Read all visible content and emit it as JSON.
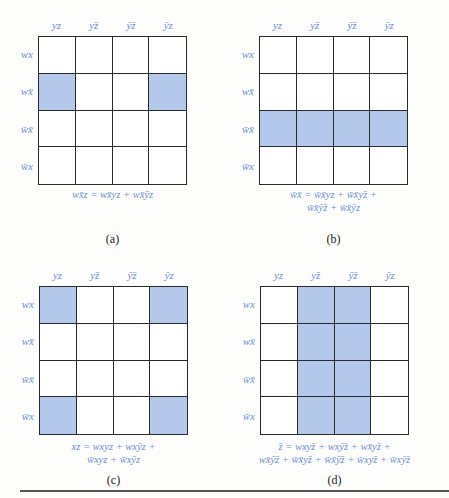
{
  "diagram": {
    "type": "Karnaugh maps (4-variable)",
    "column_headers": [
      "yz",
      "yz̄",
      "ȳz̄",
      "ȳz"
    ],
    "row_headers": [
      "wx",
      "wx̄",
      "w̄x̄",
      "w̄x"
    ],
    "highlight_color": "#b3c8ea",
    "label_color": "#6f8fcf",
    "panels": [
      {
        "id": "a",
        "caption": "(a)",
        "highlighted_cells": [
          [
            1,
            0
          ],
          [
            1,
            3
          ]
        ],
        "formula_lines": [
          "wx̄z = wx̄yz + wx̄ȳz"
        ]
      },
      {
        "id": "b",
        "caption": "(b)",
        "highlighted_cells": [
          [
            2,
            0
          ],
          [
            2,
            1
          ],
          [
            2,
            2
          ],
          [
            2,
            3
          ]
        ],
        "formula_lines": [
          "w̄x̄ = w̄x̄yz + w̄x̄yz̄ +",
          "w̄x̄ȳz̄ + w̄x̄ȳz"
        ]
      },
      {
        "id": "c",
        "caption": "(c)",
        "highlighted_cells": [
          [
            0,
            0
          ],
          [
            0,
            3
          ],
          [
            3,
            0
          ],
          [
            3,
            3
          ]
        ],
        "formula_lines": [
          "xz = wxyz + wxȳz +",
          "w̄xyz + w̄xȳz"
        ]
      },
      {
        "id": "d",
        "caption": "(d)",
        "highlighted_cells": [
          [
            0,
            1
          ],
          [
            0,
            2
          ],
          [
            1,
            1
          ],
          [
            1,
            2
          ],
          [
            2,
            1
          ],
          [
            2,
            2
          ],
          [
            3,
            1
          ],
          [
            3,
            2
          ]
        ],
        "formula_lines": [
          "z̄ = wxyz̄ + wxȳz̄ + wx̄yz̄ +",
          "wx̄ȳz̄ + w̄x̄yz̄ + w̄x̄ȳz̄ + w̄xyz̄ + w̄xȳz̄"
        ]
      }
    ]
  }
}
